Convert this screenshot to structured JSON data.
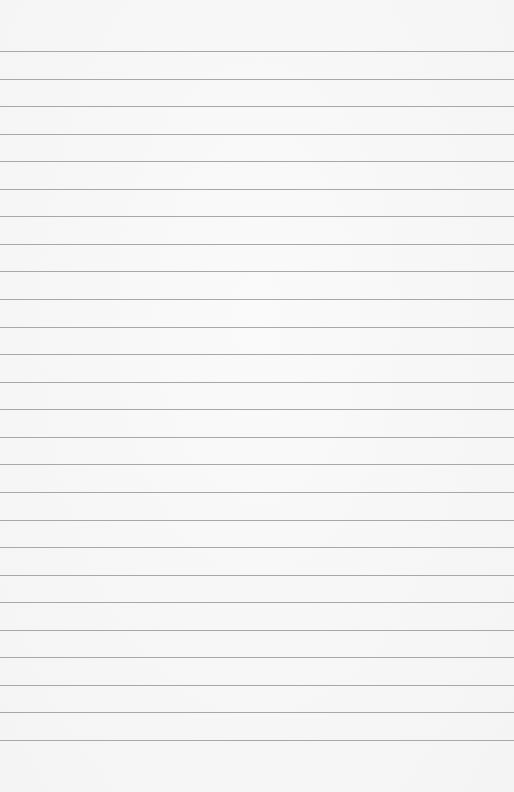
{
  "paper": {
    "background": "#f7f7f7",
    "rule_color": "#9a9a9a",
    "first_rule_y": 51,
    "rule_spacing": 27.56,
    "rule_count": 26
  }
}
